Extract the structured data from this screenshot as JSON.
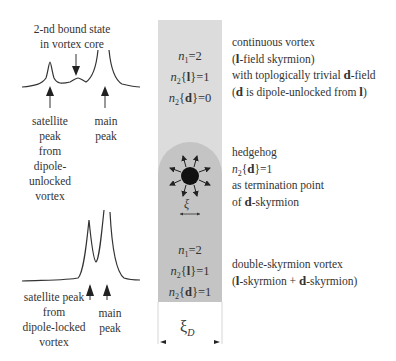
{
  "top_spectrum": {
    "label_bound_state": [
      "2-nd bound state",
      "in vortex core"
    ],
    "label_satellite": [
      "satellite",
      "peak",
      "from",
      "dipole-",
      "unlocked",
      "vortex"
    ],
    "label_main": [
      "main",
      "peak"
    ]
  },
  "bottom_spectrum": {
    "label_satellite": [
      "satellite peak",
      "from",
      "dipole-locked",
      "vortex"
    ],
    "label_main": [
      "main",
      "peak"
    ]
  },
  "strip": {
    "top_quantum_numbers": {
      "n1": "=2",
      "n2_l": "=1",
      "n2_d": "=0"
    },
    "bottom_quantum_numbers": {
      "n1": "=2",
      "n2_l": "=1",
      "n2_d": "=1"
    },
    "hedgehog_size_label": "ξ",
    "width_label": "ξ",
    "width_label_sub": "D"
  },
  "right_annotations": {
    "continuous": {
      "line1": "continuous vortex",
      "line2_pre": "(",
      "line2_bold": "l",
      "line2_post": "-field skyrmion)",
      "line3_pre": "with toplogically trivial ",
      "line3_bold": "d",
      "line3_post": "-field",
      "line4_pre": "(",
      "line4_bold1": "d",
      "line4_mid": " is dipole-unlocked from ",
      "line4_bold2": "l",
      "line4_post": ")"
    },
    "hedgehog": {
      "line1": "hedgehog",
      "line2": "=1",
      "line3": "as termination point",
      "line4_pre": "of  ",
      "line4_bold": "d",
      "line4_post": "-skyrmion"
    },
    "double": {
      "line1": "double-skyrmion vortex",
      "line2_pre": "(",
      "line2_bold1": "l",
      "line2_mid": "-skyrmion + ",
      "line2_bold2": "d",
      "line2_post": "-skyrmion)"
    }
  },
  "symbols": {
    "n": "n",
    "sub1": "1",
    "sub2": "2",
    "l": "l",
    "d": "d",
    "lbrace": "{",
    "rbrace": "}"
  }
}
